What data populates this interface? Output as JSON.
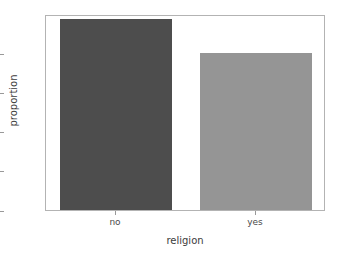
{
  "chart_data": {
    "type": "bar",
    "title": "",
    "xlabel": "religion",
    "ylabel": "proportion",
    "categories": [
      "no",
      "yes"
    ],
    "values": [
      9.75,
      8.0
    ],
    "series": [
      {
        "name": "proportion",
        "values": [
          9.75,
          8.0
        ]
      }
    ],
    "bar_colors": [
      "#4d4d4d",
      "#959595"
    ],
    "ylim": [
      0,
      10
    ],
    "xlim": [
      -0.5,
      1.5
    ],
    "yticks": [
      0,
      2,
      4,
      6,
      8
    ],
    "ytick_labels": [
      "0",
      "2",
      "4",
      "6",
      "8"
    ],
    "xtick_labels": [
      "no",
      "yes"
    ],
    "grid": false,
    "legend": false,
    "legend_position": "none",
    "frame": true,
    "background_color": "#ffffff",
    "axis_color": "#b3b3b3",
    "tick_color": "#999999",
    "text_color": "#4a4a4a"
  }
}
